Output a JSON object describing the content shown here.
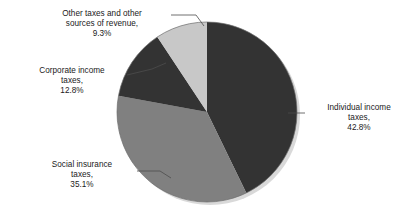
{
  "chart_data": {
    "type": "pie",
    "title": "",
    "subtitle": "",
    "xlabel": "",
    "ylabel": "",
    "legend_position": "none",
    "grid": false,
    "units": "percent",
    "start_angle_deg": 0,
    "direction": "clockwise",
    "categories": [
      "Individual income taxes",
      "Social insurance taxes",
      "Corporate income taxes",
      "Other taxes and other sources of revenue"
    ],
    "values": [
      42.8,
      35.1,
      12.8,
      9.3
    ],
    "colors": [
      "#333333",
      "#808080",
      "#333333",
      "#c8c8c8"
    ],
    "slices": [
      {
        "name": "Individual income taxes",
        "value": 42.8,
        "value_label": "42.8%",
        "color": "#333333",
        "start_deg": 0,
        "end_deg": 154.08,
        "label_lines": [
          "Individual income",
          "taxes,",
          "42.8%"
        ]
      },
      {
        "name": "Social insurance taxes",
        "value": 35.1,
        "value_label": "35.1%",
        "color": "#808080",
        "start_deg": 154.08,
        "end_deg": 280.44,
        "label_lines": [
          "Social insurance",
          "taxes,",
          "35.1%"
        ]
      },
      {
        "name": "Corporate income taxes",
        "value": 12.8,
        "value_label": "12.8%",
        "color": "#333333",
        "start_deg": 280.44,
        "end_deg": 326.52,
        "label_lines": [
          "Corporate income",
          "taxes,",
          "12.8%"
        ]
      },
      {
        "name": "Other taxes and other sources of revenue",
        "value": 9.3,
        "value_label": "9.3%",
        "color": "#c8c8c8",
        "start_deg": 326.52,
        "end_deg": 360,
        "label_lines": [
          "Other taxes and other",
          "sources of revenue,",
          "9.3%"
        ]
      }
    ]
  },
  "labels": {
    "other": {
      "line1": "Other taxes and other",
      "line2": "sources of revenue,",
      "line3": "9.3%"
    },
    "corporate": {
      "line1": "Corporate income",
      "line2": "taxes,",
      "line3": "12.8%"
    },
    "social": {
      "line1": "Social insurance",
      "line2": "taxes,",
      "line3": "35.1%"
    },
    "individual": {
      "line1": "Individual income",
      "line2": "taxes,",
      "line3": "42.8%"
    }
  },
  "style": {
    "background": "#ffffff",
    "text_color": "#1a1a1a",
    "slice_dark": "#333333",
    "slice_medium": "#808080",
    "slice_light": "#c8c8c8",
    "leader_line_color": "#555555",
    "shadow_color": "#d8d8d8"
  }
}
